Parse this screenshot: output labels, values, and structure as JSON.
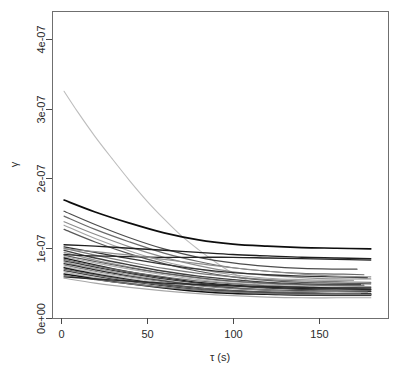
{
  "chart_data": {
    "type": "line",
    "title": "",
    "subtitle": "",
    "xlabel": "τ (s)",
    "ylabel": "γ",
    "xlim": [
      -5,
      190
    ],
    "ylim": [
      0,
      4.4e-07
    ],
    "grid": false,
    "legend": false,
    "legend_position": "none",
    "background": "#ffffff",
    "box": true,
    "xticks": [
      0,
      50,
      100,
      150
    ],
    "xtick_labels": [
      "0",
      "50",
      "100",
      "150"
    ],
    "yticks": [
      0,
      1e-07,
      2e-07,
      3e-07,
      4e-07
    ],
    "ytick_labels": [
      "0e+00",
      "1e-07",
      "2e-07",
      "3e-07",
      "4e-07"
    ],
    "n_series": 31,
    "series": [
      {
        "name": "curve-01",
        "color": "#bdbdbd",
        "width": 1.1,
        "x": [
          2,
          10,
          20,
          30,
          40,
          50,
          60,
          70,
          80,
          90,
          100,
          110,
          120
        ],
        "y": [
          3.25e-07,
          2.95e-07,
          2.6e-07,
          2.28e-07,
          1.97e-07,
          1.68e-07,
          1.42e-07,
          1.18e-07,
          9.8e-08,
          8e-08,
          6.4e-08,
          5.2e-08,
          4.2e-08
        ]
      },
      {
        "name": "curve-02",
        "color": "#0d0d0d",
        "width": 1.7,
        "x": [
          2,
          20,
          40,
          60,
          80,
          100,
          120,
          140,
          160,
          180
        ],
        "y": [
          1.69e-07,
          1.52e-07,
          1.36e-07,
          1.22e-07,
          1.12e-07,
          1.06e-07,
          1.03e-07,
          1.01e-07,
          1e-07,
          9.9e-08
        ]
      },
      {
        "name": "curve-03",
        "color": "#4d4d4d",
        "width": 1.3,
        "x": [
          2,
          20,
          40,
          60,
          80,
          100,
          120,
          140,
          160,
          172
        ],
        "y": [
          1.53e-07,
          1.34e-07,
          1.15e-07,
          9.9e-08,
          8.7e-08,
          7.9e-08,
          7.4e-08,
          7.1e-08,
          7e-08,
          7e-08
        ]
      },
      {
        "name": "curve-04",
        "color": "#6b6b6b",
        "width": 1.2,
        "x": [
          2,
          20,
          40,
          60,
          80,
          100,
          120,
          140,
          160,
          176
        ],
        "y": [
          1.46e-07,
          1.27e-07,
          1.09e-07,
          9.3e-08,
          8.1e-08,
          7.2e-08,
          6.7e-08,
          6.4e-08,
          6.3e-08,
          6.2e-08
        ]
      },
      {
        "name": "curve-05",
        "color": "#8c8c8c",
        "width": 1.2,
        "x": [
          2,
          20,
          40,
          60,
          80,
          100,
          120,
          140,
          160,
          180
        ],
        "y": [
          1.38e-07,
          1.2e-07,
          1.02e-07,
          8.7e-08,
          7.5e-08,
          6.6e-08,
          6.1e-08,
          5.8e-08,
          5.6e-08,
          5.6e-08
        ]
      },
      {
        "name": "curve-06",
        "color": "#a3a3a3",
        "width": 1.2,
        "x": [
          2,
          20,
          40,
          60,
          80,
          100,
          120,
          140,
          160,
          170
        ],
        "y": [
          1.33e-07,
          1.14e-07,
          9.6e-08,
          8.1e-08,
          7e-08,
          6.2e-08,
          5.7e-08,
          5.5e-08,
          5.4e-08,
          5.4e-08
        ]
      },
      {
        "name": "curve-07",
        "color": "#575757",
        "width": 1.2,
        "x": [
          2,
          20,
          40,
          60,
          80,
          100,
          120,
          140,
          160,
          180
        ],
        "y": [
          1.27e-07,
          1.09e-07,
          9.2e-08,
          7.8e-08,
          6.7e-08,
          5.9e-08,
          5.4e-08,
          5.1e-08,
          5e-08,
          4.9e-08
        ]
      },
      {
        "name": "curve-08",
        "color": "#1f1f1f",
        "width": 1.4,
        "x": [
          2,
          20,
          40,
          60,
          80,
          100,
          120,
          140,
          160,
          180
        ],
        "y": [
          1.05e-07,
          1.03e-07,
          1e-07,
          9.7e-08,
          9.4e-08,
          9.1e-08,
          8.9e-08,
          8.7e-08,
          8.6e-08,
          8.5e-08
        ]
      },
      {
        "name": "curve-09",
        "color": "#333333",
        "width": 1.3,
        "x": [
          2,
          20,
          40,
          60,
          80,
          100,
          120,
          140,
          160,
          178
        ],
        "y": [
          1.02e-07,
          9.4e-08,
          8.5e-08,
          7.7e-08,
          7e-08,
          6.5e-08,
          6.2e-08,
          6e-08,
          5.9e-08,
          5.8e-08
        ]
      },
      {
        "name": "curve-10",
        "color": "#7a7a7a",
        "width": 1.2,
        "x": [
          2,
          20,
          40,
          60,
          80,
          100,
          120,
          140,
          160,
          180
        ],
        "y": [
          1e-07,
          9e-08,
          8e-08,
          7.1e-08,
          6.4e-08,
          5.9e-08,
          5.5e-08,
          5.3e-08,
          5.2e-08,
          5.1e-08
        ]
      },
      {
        "name": "curve-11",
        "color": "#404040",
        "width": 1.3,
        "x": [
          2,
          20,
          40,
          60,
          80,
          100,
          120,
          140,
          160,
          174
        ],
        "y": [
          9.7e-08,
          8.6e-08,
          7.6e-08,
          6.7e-08,
          6e-08,
          5.5e-08,
          5.1e-08,
          4.9e-08,
          4.8e-08,
          4.8e-08
        ]
      },
      {
        "name": "curve-12",
        "color": "#949494",
        "width": 1.2,
        "x": [
          2,
          20,
          40,
          60,
          80,
          100,
          120,
          140,
          160,
          180
        ],
        "y": [
          9.4e-08,
          8.3e-08,
          7.3e-08,
          6.4e-08,
          5.7e-08,
          5.2e-08,
          4.9e-08,
          4.7e-08,
          4.6e-08,
          4.5e-08
        ]
      },
      {
        "name": "curve-13",
        "color": "#262626",
        "width": 1.3,
        "x": [
          2,
          20,
          40,
          60,
          80,
          100,
          120,
          140,
          160,
          180
        ],
        "y": [
          9.1e-08,
          8.9e-08,
          8.8e-08,
          8.7e-08,
          8.7e-08,
          8.7e-08,
          8.6e-08,
          8.5e-08,
          8.4e-08,
          8.3e-08
        ]
      },
      {
        "name": "curve-14",
        "color": "#5c5c5c",
        "width": 1.2,
        "x": [
          2,
          20,
          40,
          60,
          80,
          100,
          120,
          140,
          160,
          176
        ],
        "y": [
          9e-08,
          8.1e-08,
          7.2e-08,
          6.4e-08,
          5.8e-08,
          5.3e-08,
          5e-08,
          4.8e-08,
          4.7e-08,
          4.7e-08
        ]
      },
      {
        "name": "curve-15",
        "color": "#adadad",
        "width": 1.2,
        "x": [
          2,
          20,
          40,
          60,
          80,
          100,
          120,
          140,
          160,
          180
        ],
        "y": [
          8.8e-08,
          7.9e-08,
          7e-08,
          6.2e-08,
          5.5e-08,
          5e-08,
          4.7e-08,
          4.5e-08,
          4.4e-08,
          4.4e-08
        ]
      },
      {
        "name": "curve-16",
        "color": "#171717",
        "width": 1.4,
        "x": [
          2,
          20,
          40,
          60,
          80,
          100,
          120,
          140,
          160,
          180
        ],
        "y": [
          8.6e-08,
          7.6e-08,
          6.6e-08,
          5.8e-08,
          5.1e-08,
          4.7e-08,
          4.4e-08,
          4.2e-08,
          4.2e-08,
          4.1e-08
        ]
      },
      {
        "name": "curve-17",
        "color": "#6e6e6e",
        "width": 1.2,
        "x": [
          2,
          20,
          40,
          60,
          80,
          100,
          120,
          140,
          160,
          172
        ],
        "y": [
          8.4e-08,
          7.5e-08,
          6.6e-08,
          5.9e-08,
          5.3e-08,
          4.9e-08,
          4.6e-08,
          4.4e-08,
          4.3e-08,
          4.3e-08
        ]
      },
      {
        "name": "curve-18",
        "color": "#3b3b3b",
        "width": 1.3,
        "x": [
          2,
          20,
          40,
          60,
          80,
          100,
          120,
          140,
          160,
          180
        ],
        "y": [
          8.2e-08,
          7.3e-08,
          6.4e-08,
          5.6e-08,
          5e-08,
          4.6e-08,
          4.3e-08,
          4.1e-08,
          4e-08,
          4e-08
        ]
      },
      {
        "name": "curve-19",
        "color": "#9c9c9c",
        "width": 1.2,
        "x": [
          2,
          20,
          40,
          60,
          80,
          100,
          120,
          140,
          160,
          180
        ],
        "y": [
          8e-08,
          7.1e-08,
          6.2e-08,
          5.4e-08,
          4.8e-08,
          4.4e-08,
          4.1e-08,
          3.9e-08,
          3.9e-08,
          3.8e-08
        ]
      },
      {
        "name": "curve-20",
        "color": "#2e2e2e",
        "width": 1.3,
        "x": [
          2,
          20,
          40,
          60,
          80,
          100,
          120,
          140,
          160,
          180
        ],
        "y": [
          7.8e-08,
          6.9e-08,
          6e-08,
          5.3e-08,
          4.7e-08,
          4.3e-08,
          4e-08,
          3.9e-08,
          3.8e-08,
          3.8e-08
        ]
      },
      {
        "name": "curve-21",
        "color": "#828282",
        "width": 1.2,
        "x": [
          2,
          20,
          40,
          60,
          80,
          100,
          120,
          140,
          160,
          178
        ],
        "y": [
          7.6e-08,
          6.7e-08,
          5.9e-08,
          5.2e-08,
          4.6e-08,
          4.2e-08,
          4e-08,
          3.8e-08,
          3.8e-08,
          3.7e-08
        ]
      },
      {
        "name": "curve-22",
        "color": "#c2c2c2",
        "width": 1.2,
        "x": [
          2,
          20,
          40,
          60,
          80,
          100,
          120,
          140,
          160,
          180
        ],
        "y": [
          7.4e-08,
          6.5e-08,
          5.7e-08,
          5e-08,
          4.4e-08,
          4e-08,
          3.7e-08,
          3.6e-08,
          3.5e-08,
          3.5e-08
        ]
      },
      {
        "name": "curve-23",
        "color": "#1a1a1a",
        "width": 1.4,
        "x": [
          2,
          20,
          40,
          60,
          80,
          100,
          120,
          140,
          160,
          180
        ],
        "y": [
          7.2e-08,
          6.3e-08,
          5.5e-08,
          4.8e-08,
          4.3e-08,
          3.9e-08,
          3.7e-08,
          3.6e-08,
          3.5e-08,
          3.5e-08
        ]
      },
      {
        "name": "curve-24",
        "color": "#666666",
        "width": 1.2,
        "x": [
          2,
          20,
          40,
          60,
          80,
          100,
          120,
          140,
          160,
          174
        ],
        "y": [
          7e-08,
          6.2e-08,
          5.4e-08,
          4.8e-08,
          4.3e-08,
          3.9e-08,
          3.7e-08,
          3.6e-08,
          3.5e-08,
          3.5e-08
        ]
      },
      {
        "name": "curve-25",
        "color": "#454545",
        "width": 1.3,
        "x": [
          2,
          20,
          40,
          60,
          80,
          100,
          120,
          140,
          160,
          180
        ],
        "y": [
          6.8e-08,
          6e-08,
          5.2e-08,
          4.6e-08,
          4.1e-08,
          3.8e-08,
          3.6e-08,
          3.5e-08,
          3.4e-08,
          3.4e-08
        ]
      },
      {
        "name": "curve-26",
        "color": "#b5b5b5",
        "width": 1.2,
        "x": [
          2,
          20,
          40,
          60,
          80,
          100,
          120,
          140,
          160,
          180
        ],
        "y": [
          6.6e-08,
          5.8e-08,
          5.1e-08,
          4.4e-08,
          3.9e-08,
          3.6e-08,
          3.4e-08,
          3.3e-08,
          3.2e-08,
          3.2e-08
        ]
      },
      {
        "name": "curve-27",
        "color": "#111111",
        "width": 1.5,
        "x": [
          2,
          20,
          40,
          60,
          80,
          100,
          120,
          140,
          160,
          180
        ],
        "y": [
          6.3e-08,
          5.6e-08,
          4.9e-08,
          4.3e-08,
          3.8e-08,
          3.5e-08,
          3.4e-08,
          3.3e-08,
          3.3e-08,
          3.3e-08
        ]
      },
      {
        "name": "curve-28",
        "color": "#787878",
        "width": 1.2,
        "x": [
          2,
          20,
          40,
          60,
          80,
          100,
          120,
          140,
          160,
          180
        ],
        "y": [
          6.1e-08,
          5.5e-08,
          4.9e-08,
          4.4e-08,
          4e-08,
          3.7e-08,
          3.5e-08,
          3.4e-08,
          3.4e-08,
          3.4e-08
        ]
      },
      {
        "name": "curve-29",
        "color": "#2a2a2a",
        "width": 1.4,
        "x": [
          2,
          20,
          40,
          60,
          80,
          100,
          120,
          140,
          160,
          180
        ],
        "y": [
          5.9e-08,
          5.6e-08,
          5.3e-08,
          5e-08,
          4.8e-08,
          4.6e-08,
          4.5e-08,
          4.4e-08,
          4.3e-08,
          4.3e-08
        ]
      },
      {
        "name": "curve-30",
        "color": "#a8a8a8",
        "width": 1.2,
        "x": [
          2,
          20,
          40,
          60,
          80,
          100,
          120,
          140,
          160,
          180
        ],
        "y": [
          5.7e-08,
          5e-08,
          4.4e-08,
          3.9e-08,
          3.5e-08,
          3.2e-08,
          3e-08,
          2.9e-08,
          2.9e-08,
          2.9e-08
        ]
      },
      {
        "name": "curve-31",
        "color": "#8f8f8f",
        "width": 1.2,
        "x": [
          2,
          20,
          40,
          60,
          80,
          100,
          120,
          140,
          160,
          180
        ],
        "y": [
          9.9e-08,
          9.5e-08,
          9e-08,
          8.4e-08,
          7.8e-08,
          7.2e-08,
          6.7e-08,
          6.3e-08,
          6e-08,
          5.9e-08
        ]
      }
    ]
  }
}
